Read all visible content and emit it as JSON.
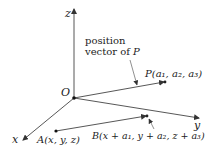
{
  "diagram": {
    "axes": {
      "x_label": "x",
      "y_label": "y",
      "z_label": "z",
      "origin_label": "O"
    },
    "annotation": {
      "line1": "position",
      "line2_prefix": "vector of ",
      "line2_var": "P"
    },
    "points": {
      "P": "P(a₁, a₂, a₃)",
      "A": "A(x, y, z)",
      "B": "B(x + a₁, y + a₂, z + a₃)"
    },
    "colors": {
      "line": "#333333",
      "text": "#222222",
      "background": "#ffffff"
    }
  }
}
